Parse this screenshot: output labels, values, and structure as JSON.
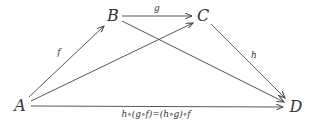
{
  "diagram": {
    "type": "commutative-diagram",
    "nodes": [
      {
        "id": "A",
        "label": "A"
      },
      {
        "id": "B",
        "label": "B"
      },
      {
        "id": "C",
        "label": "C"
      },
      {
        "id": "D",
        "label": "D"
      }
    ],
    "edges": [
      {
        "from": "A",
        "to": "B",
        "label": "f"
      },
      {
        "from": "B",
        "to": "C",
        "label": "g"
      },
      {
        "from": "C",
        "to": "D",
        "label": "h"
      },
      {
        "from": "A",
        "to": "C",
        "label": ""
      },
      {
        "from": "B",
        "to": "D",
        "label": ""
      },
      {
        "from": "A",
        "to": "D",
        "label": "h∘(g∘f)=(h∘g)∘f"
      }
    ],
    "colors": {
      "stroke": "#444444",
      "text": "#333333",
      "background": "#ffffff"
    }
  }
}
